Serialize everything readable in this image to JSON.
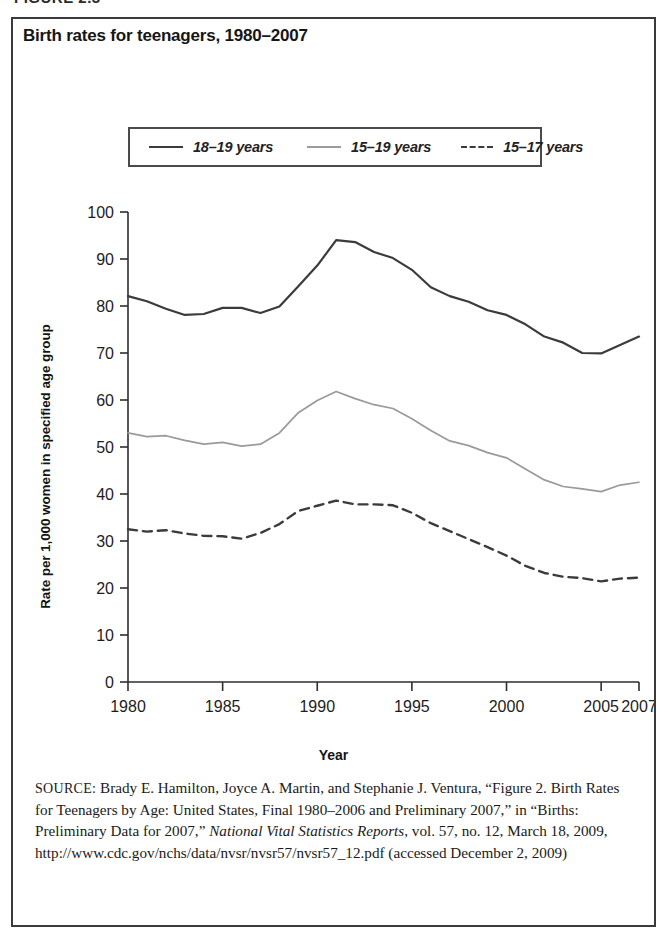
{
  "figure_header": "FIGURE 2.3",
  "chart": {
    "title": "Birth rates for teenagers, 1980–2007",
    "xlabel": "Year",
    "ylabel": "Rate per 1,000 women in specified age group"
  },
  "legend": {
    "items": [
      {
        "label": "18–19 years",
        "style": "solid-dark",
        "color": "#3b3b3b"
      },
      {
        "label": "15–19 years",
        "style": "solid-gray",
        "color": "#9a9a9a"
      },
      {
        "label": "15–17 years",
        "style": "dashed-dark",
        "color": "#3b3b3b"
      }
    ]
  },
  "source": {
    "kicker": "SOURCE:",
    "part1": " Brady E. Hamilton, Joyce A. Martin, and Stephanie J. Ventura, “Figure 2. Birth Rates for Teenagers by Age: United States, Final 1980–2006 and Preliminary 2007,” in “Births: Preliminary Data for 2007,” ",
    "italic": "National Vital Statistics Reports",
    "part2": ", vol. 57, no. 12, March 18, 2009, http://www.cdc.gov/nchs/data/nvsr/nvsr57/nvsr57_12.pdf (accessed December 2, 2009)"
  },
  "chart_data": {
    "type": "line",
    "title": "Birth rates for teenagers, 1980–2007",
    "xlabel": "Year",
    "ylabel": "Rate per 1,000 women in specified age group",
    "xlim": [
      1980,
      2007
    ],
    "ylim": [
      0,
      100
    ],
    "ytick_labels": [
      "0",
      "10",
      "20",
      "30",
      "40",
      "50",
      "60",
      "70",
      "80",
      "90",
      "100"
    ],
    "yticks": [
      0,
      10,
      20,
      30,
      40,
      50,
      60,
      70,
      80,
      90,
      100
    ],
    "xtick_labels": [
      "1980",
      "1985",
      "1990",
      "1995",
      "2000",
      "2005",
      "2007"
    ],
    "xticks": [
      1980,
      1985,
      1990,
      1995,
      2000,
      2005,
      2007
    ],
    "grid": false,
    "legend_position": "top-center",
    "x": [
      1980,
      1981,
      1982,
      1983,
      1984,
      1985,
      1986,
      1987,
      1988,
      1989,
      1990,
      1991,
      1992,
      1993,
      1994,
      1995,
      1996,
      1997,
      1998,
      1999,
      2000,
      2001,
      2002,
      2003,
      2004,
      2005,
      2006,
      2007
    ],
    "series": [
      {
        "name": "18–19 years",
        "style": "solid",
        "color": "#3b3b3b",
        "values": [
          82.1,
          81.0,
          79.4,
          78.1,
          78.3,
          79.6,
          79.6,
          78.5,
          79.9,
          84.2,
          88.6,
          94.0,
          93.6,
          91.5,
          90.2,
          87.7,
          84.0,
          82.1,
          80.9,
          79.1,
          78.1,
          76.1,
          73.5,
          72.2,
          70.0,
          69.9,
          71.7,
          73.5
        ]
      },
      {
        "name": "15–19 years",
        "style": "solid",
        "color": "#9a9a9a",
        "values": [
          53.0,
          52.2,
          52.4,
          51.4,
          50.6,
          51.0,
          50.2,
          50.6,
          53.0,
          57.3,
          59.9,
          61.8,
          60.3,
          59.0,
          58.2,
          56.0,
          53.5,
          51.3,
          50.3,
          48.8,
          47.7,
          45.3,
          43.0,
          41.6,
          41.1,
          40.5,
          41.9,
          42.5
        ]
      },
      {
        "name": "15–17 years",
        "style": "dashed",
        "color": "#3b3b3b",
        "values": [
          32.5,
          32.0,
          32.3,
          31.6,
          31.1,
          31.0,
          30.5,
          31.7,
          33.6,
          36.4,
          37.5,
          38.6,
          37.8,
          37.8,
          37.6,
          36.0,
          33.8,
          32.1,
          30.4,
          28.7,
          26.9,
          24.7,
          23.2,
          22.4,
          22.1,
          21.4,
          22.0,
          22.2
        ]
      }
    ]
  }
}
